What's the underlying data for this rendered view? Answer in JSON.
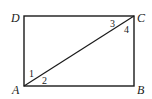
{
  "diagram": {
    "type": "rectangle-with-diagonal",
    "vertices": {
      "A": {
        "label": "A",
        "x": 24,
        "y": 86
      },
      "B": {
        "label": "B",
        "x": 134,
        "y": 86
      },
      "C": {
        "label": "C",
        "x": 134,
        "y": 16
      },
      "D": {
        "label": "D",
        "x": 24,
        "y": 16
      }
    },
    "segments": [
      "AB",
      "BC",
      "CD",
      "DA",
      "AC"
    ],
    "angle_labels": [
      "1",
      "2",
      "3",
      "4"
    ],
    "stroke_color": "#1a1a1a"
  }
}
